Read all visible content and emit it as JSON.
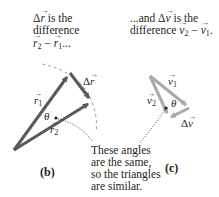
{
  "panel_b": {
    "caption_line1_delta": "Δ",
    "caption_line1_var": "r",
    "caption_line1_rest": " is the",
    "caption_line2": "difference",
    "caption_line3_a": "r",
    "caption_line3_a_sub": "2",
    "caption_line3_op": " − ",
    "caption_line3_b": "r",
    "caption_line3_b_sub": "1",
    "caption_line3_tail": "...",
    "vector_r1_label": "r",
    "vector_r1_sub": "1",
    "vector_r2_label": "r",
    "vector_r2_sub": "2",
    "delta_r_delta": "Δ",
    "delta_r_var": "r",
    "angle_label": "θ",
    "panel_label": "(b)"
  },
  "panel_c": {
    "caption_line1_pre": "...and Δ",
    "caption_line1_var": "v",
    "caption_line1_rest": " is the",
    "caption_line2_pre": "difference ",
    "caption_line2_a": "v",
    "caption_line2_a_sub": "2",
    "caption_line2_op": " − ",
    "caption_line2_b": "v",
    "caption_line2_b_sub": "1",
    "caption_line2_tail": ".",
    "vector_v1_label": "v",
    "vector_v1_sub": "1",
    "vector_v2_label": "v",
    "vector_v2_sub": "2",
    "delta_v_delta": "Δ",
    "delta_v_var": "v",
    "angle_label": "θ",
    "panel_label": "(c)"
  },
  "annotation": {
    "line1": "These angles",
    "line2": "are the same,",
    "line3": "so the triangles",
    "line4": "are similar."
  },
  "colors": {
    "dark_vector": "#5a5a5c",
    "light_vector": "#a7a9ac",
    "text": "#231f20",
    "dashed_arc": "#808080"
  }
}
